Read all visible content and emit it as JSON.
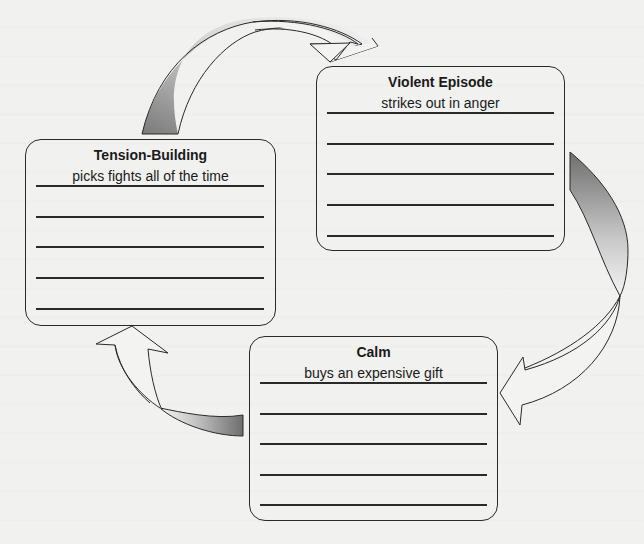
{
  "diagram": {
    "type": "cycle",
    "colors": {
      "background": "#f1f1ef",
      "stroke": "#2a2a2a",
      "arrow_gradient_dark": "#777777",
      "arrow_gradient_light": "#e6e6e6"
    },
    "stages": [
      {
        "id": "tension-building",
        "title": "Tension-Building",
        "example": "picks fights all of the time",
        "blank_lines": 5
      },
      {
        "id": "violent-episode",
        "title": "Violent Episode",
        "example": "strikes out in anger",
        "blank_lines": 5
      },
      {
        "id": "calm",
        "title": "Calm",
        "example": "buys an expensive gift",
        "blank_lines": 5
      }
    ],
    "arrows": [
      {
        "from": "tension-building",
        "to": "violent-episode",
        "direction": "clockwise-top"
      },
      {
        "from": "violent-episode",
        "to": "calm",
        "direction": "clockwise-right"
      },
      {
        "from": "calm",
        "to": "tension-building",
        "direction": "clockwise-bottom-left"
      }
    ]
  }
}
